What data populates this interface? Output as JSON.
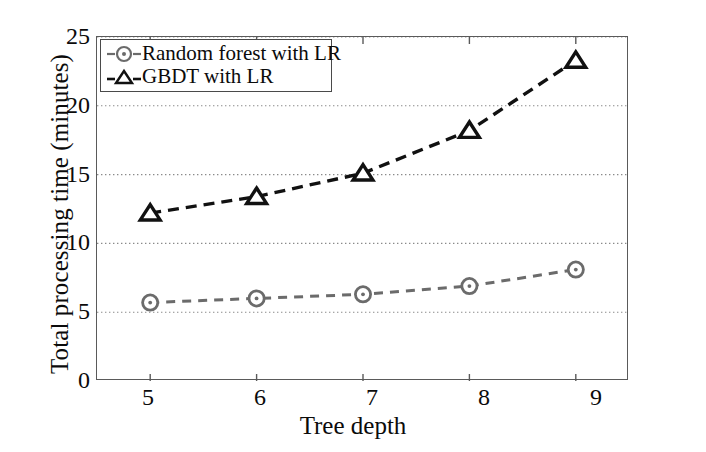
{
  "chart_data": {
    "type": "line",
    "title": "",
    "xlabel": "Tree depth",
    "ylabel": "Total processing time (minutes)",
    "x": [
      5,
      6,
      7,
      8,
      9
    ],
    "xtick_labels": [
      "5",
      "6",
      "7",
      "8",
      "9"
    ],
    "ytick_labels": [
      "0",
      "5",
      "10",
      "15",
      "20",
      "25"
    ],
    "yticks": [
      0,
      5,
      10,
      15,
      20,
      25
    ],
    "xlim": [
      4.5,
      9.5
    ],
    "ylim": [
      0,
      25
    ],
    "grid": "horizontal-dotted",
    "legend_position": "top-left-inside",
    "series": [
      {
        "name": "Random forest with LR",
        "marker": "circle",
        "linestyle": "dashed",
        "color": "#6b6b6b",
        "values": [
          5.7,
          6.0,
          6.3,
          6.9,
          8.1
        ]
      },
      {
        "name": "GBDT with LR",
        "marker": "triangle",
        "linestyle": "dashed",
        "color": "#111111",
        "values": [
          12.2,
          13.4,
          15.1,
          18.2,
          23.3
        ]
      }
    ]
  },
  "axes": {
    "y_title": "Total processing time (minutes)",
    "x_title": "Tree depth"
  },
  "legend": {
    "items": [
      {
        "label": "Random forest with LR",
        "marker": "circle-marker-icon"
      },
      {
        "label": "GBDT with LR",
        "marker": "triangle-marker-icon"
      }
    ]
  },
  "ticks": {
    "y": [
      "25",
      "20",
      "15",
      "10",
      "5",
      "0"
    ],
    "x": [
      "5",
      "6",
      "7",
      "8",
      "9"
    ]
  }
}
